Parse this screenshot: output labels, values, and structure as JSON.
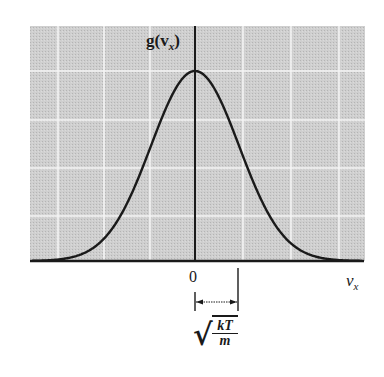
{
  "figure": {
    "title": "",
    "y_axis_label": "g(v_x)",
    "y_axis_label_main": "g(v",
    "y_axis_label_sub": "x",
    "y_axis_label_close": ")",
    "x_axis_label_main": "v",
    "x_axis_label_sub": "x",
    "origin_label": "0",
    "width_annotation": {
      "label": "sqrt(kT/m)",
      "numerator": "kT",
      "denominator": "m",
      "radical": "√"
    },
    "colors": {
      "plot_background": "#c9c9c9",
      "gridlines": "#f2f2f2",
      "curve": "#1a1a1a",
      "axes": "#1a1a1a"
    }
  },
  "chart_data": {
    "type": "line",
    "title": "",
    "xlabel": "v_x",
    "ylabel": "g(v_x)",
    "x_units": "standard deviations (sqrt(kT/m))",
    "x": [
      -3.5,
      -3,
      -2.5,
      -2,
      -1.5,
      -1,
      -0.5,
      0,
      0.5,
      1,
      1.5,
      2,
      2.5,
      3,
      3.5
    ],
    "series": [
      {
        "name": "g(v_x)",
        "values": [
          0.002,
          0.011,
          0.044,
          0.135,
          0.325,
          0.607,
          0.882,
          1.0,
          0.882,
          0.607,
          0.325,
          0.135,
          0.044,
          0.011,
          0.002
        ]
      }
    ],
    "xlim": [
      -3.7,
      3.8
    ],
    "ylim": [
      0,
      1.2
    ],
    "x_ticks": [
      "0"
    ],
    "annotations": [
      "sqrt(kT/m) marked as width from 0 to one standard deviation"
    ],
    "grid": true,
    "legend": "none"
  }
}
